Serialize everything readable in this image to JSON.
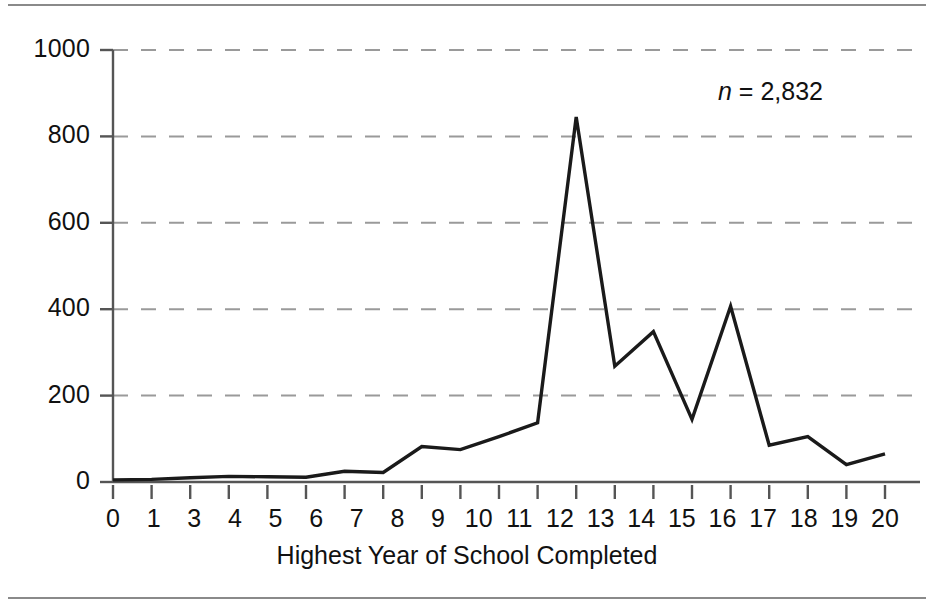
{
  "figure": {
    "annotation_italic": "n",
    "annotation_text": " = 2,832",
    "top_rule_color": "#8a8a8a",
    "line_color": "#1a1a1a",
    "gridline_color": "#9a9a9a",
    "axis_color": "#555555"
  },
  "chart_data": {
    "type": "line",
    "title": "",
    "subtitle": "",
    "xlabel": "Highest Year of School Completed",
    "ylabel": "",
    "xlim": [
      0,
      20
    ],
    "ylim": [
      0,
      1000
    ],
    "grid": true,
    "legend": null,
    "annotations": [
      {
        "text": "n = 2,832",
        "x": 18,
        "y": 900
      }
    ],
    "ytick_labels": [
      "0",
      "200",
      "400",
      "600",
      "800",
      "1000"
    ],
    "ytick_values": [
      0,
      200,
      400,
      600,
      800,
      1000
    ],
    "xtick_labels": [
      "0",
      "1",
      "3",
      "4",
      "5",
      "6",
      "7",
      "8",
      "9",
      "10",
      "11",
      "12",
      "13",
      "14",
      "15",
      "16",
      "17",
      "18",
      "19",
      "20"
    ],
    "xtick_values": [
      0,
      1,
      2,
      3,
      4,
      5,
      6,
      7,
      8,
      9,
      10,
      11,
      12,
      13,
      14,
      15,
      16,
      17,
      18,
      19,
      20
    ],
    "categories": [
      0,
      1,
      2,
      3,
      4,
      5,
      6,
      7,
      8,
      9,
      10,
      11,
      12,
      13,
      14,
      15,
      16,
      17,
      18,
      19,
      20
    ],
    "values": [
      5,
      6,
      10,
      13,
      12,
      11,
      25,
      22,
      82,
      75,
      105,
      137,
      845,
      268,
      348,
      145,
      407,
      85,
      105,
      40,
      65
    ]
  }
}
